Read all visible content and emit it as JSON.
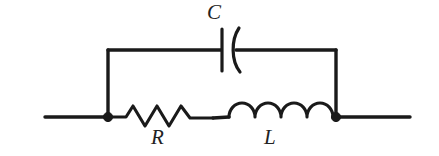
{
  "figure": {
    "background_color": "#ffffff",
    "stroke_color": "#1a1a1a",
    "width": 439,
    "height": 156
  },
  "labels": {
    "capacitor": "C",
    "resistor": "R",
    "inductor": "L"
  },
  "components": [
    {
      "id": "capacitor",
      "symbol": "capacitor-symbol",
      "label": "C",
      "branch": "top",
      "style": "curved-plate",
      "label_position": "above"
    },
    {
      "id": "resistor",
      "symbol": "resistor-symbol",
      "label": "R",
      "branch": "bottom",
      "style": "zigzag",
      "zigzag_peaks": 3,
      "label_position": "below"
    },
    {
      "id": "inductor",
      "symbol": "inductor-symbol",
      "label": "L",
      "branch": "bottom",
      "style": "coil-arcs",
      "coil_humps": 4,
      "label_position": "below"
    }
  ],
  "nodes": [
    {
      "id": "left-node",
      "type": "junction-dot"
    },
    {
      "id": "right-node",
      "type": "junction-dot"
    }
  ],
  "terminals": [
    {
      "id": "left-terminal",
      "side": "left"
    },
    {
      "id": "right-terminal",
      "side": "right"
    }
  ]
}
